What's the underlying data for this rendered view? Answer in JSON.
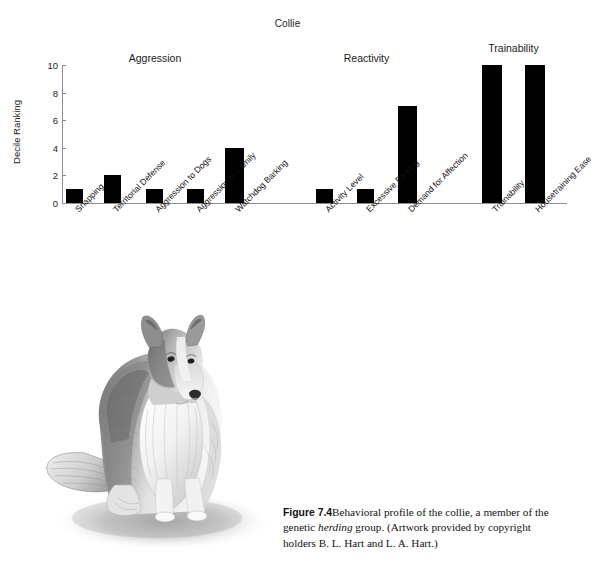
{
  "chart_data": {
    "type": "bar",
    "title": "Collie",
    "xlabel": "",
    "ylabel": "Decile Ranking",
    "ylim": [
      0,
      10
    ],
    "yticks": [
      "0",
      "2",
      "4",
      "6",
      "8",
      "10"
    ],
    "grid": false,
    "legend": "none",
    "categories": [
      "Snapping",
      "Territorial Defense",
      "Aggression to Dogs",
      "Aggression to Family",
      "Watchdog Barking",
      "Activity Level",
      "Excessive Barking",
      "Demand for Affection",
      "Trainability",
      "Housetraining Ease"
    ],
    "values": [
      1,
      2,
      1,
      1,
      4,
      1,
      1,
      7,
      10,
      10
    ],
    "bar_color": "#000000",
    "groups": [
      {
        "label": "Aggression",
        "categories": [
          "Snapping",
          "Territorial Defense",
          "Aggression to Dogs",
          "Aggression to Family",
          "Watchdog Barking"
        ]
      },
      {
        "label": "Reactivity",
        "categories": [
          "Activity Level",
          "Excessive Barking",
          "Demand for Affection"
        ]
      },
      {
        "label": "Trainability",
        "categories": [
          "Trainability",
          "Housetraining Ease"
        ]
      }
    ]
  },
  "caption": {
    "figure_number": "Figure 7.4",
    "text_part1": "Behavioral profile of the collie, a member of the genetic ",
    "italic_word": "herding",
    "text_part2": " group. (Artwork provided by copyright holders B. L. Hart and L. A. Hart.)"
  },
  "illustration": {
    "name": "collie-dog-pencil-drawing",
    "subject": "Collie"
  }
}
